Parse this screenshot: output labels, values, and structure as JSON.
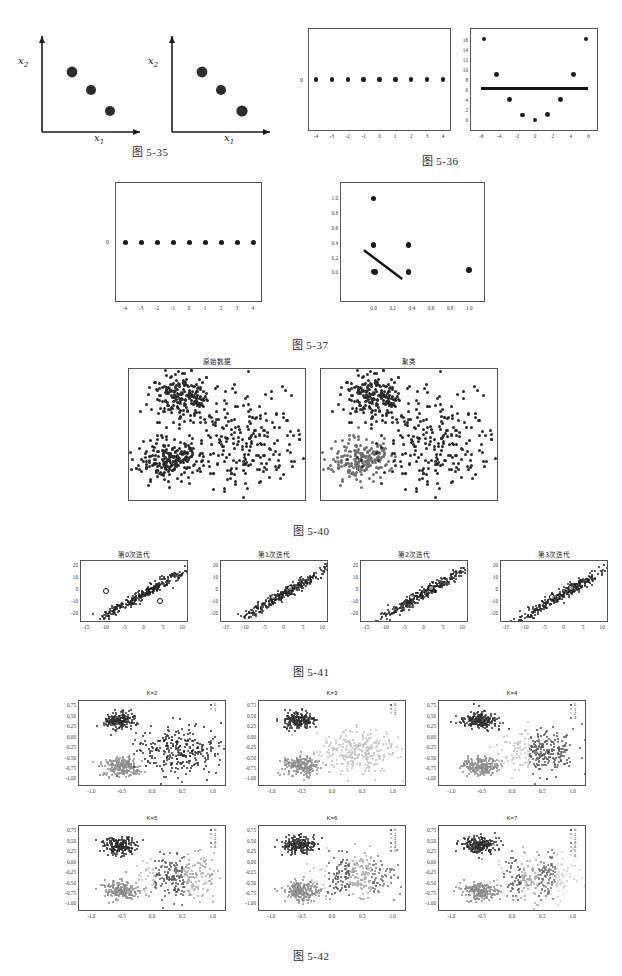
{
  "page": {
    "width": 622,
    "height": 976,
    "background": "#ffffff"
  },
  "figures": [
    {
      "id": "fig-5-35",
      "caption": "图 5-35",
      "panels": [
        {
          "id": "fig535-left",
          "axis_labels": {
            "x": "x",
            "x_sub": "1",
            "y": "x",
            "y_sub": "2"
          },
          "points": [
            [
              0.3,
              0.72
            ],
            [
              0.48,
              0.5
            ],
            [
              0.66,
              0.28
            ]
          ]
        },
        {
          "id": "fig535-right",
          "axis_labels": {
            "x": "x",
            "x_sub": "1",
            "y": "x",
            "y_sub": "2"
          },
          "points": [
            [
              0.3,
              0.72
            ],
            [
              0.48,
              0.5
            ],
            [
              0.66,
              0.28
            ]
          ]
        }
      ]
    },
    {
      "id": "fig-5-36",
      "caption": "图 5-36",
      "panels": [
        {
          "id": "fig536-left",
          "xticks": [
            "-4",
            "-3",
            "-2",
            "-1",
            "0",
            "1",
            "2",
            "3",
            "4"
          ],
          "yticks": [
            "0"
          ],
          "points_x": [
            -4,
            -3,
            -2,
            -1,
            0,
            1,
            2,
            3,
            4
          ],
          "points_y": [
            0,
            0,
            0,
            0,
            0,
            0,
            0,
            0,
            0
          ]
        },
        {
          "id": "fig536-right",
          "xticks": [
            "-6",
            "-4",
            "-2",
            "0",
            "2",
            "4",
            "6"
          ],
          "yticks": [
            "0",
            "2",
            "4",
            "6",
            "8",
            "10",
            "12",
            "14",
            "16"
          ],
          "points_x": [
            -5.7,
            -4.28,
            -2.85,
            -1.43,
            0,
            1.43,
            2.85,
            4.28,
            5.7
          ],
          "points_y": [
            16.2,
            9.1,
            4.1,
            1.1,
            0.1,
            1.2,
            4.2,
            9.1,
            16.2
          ],
          "regression_line": {
            "y": 6.4,
            "x_from": -6.0,
            "x_to": 5.9
          }
        }
      ]
    },
    {
      "id": "fig-5-37",
      "caption": "图 5-37",
      "panels": [
        {
          "id": "fig537-left",
          "xticks": [
            "-4",
            "-3",
            "-2",
            "-1",
            "0",
            "1",
            "2",
            "3",
            "4"
          ],
          "yticks": [
            "0"
          ],
          "points_x": [
            -4,
            -3,
            -2,
            -1,
            0,
            1,
            2,
            3,
            4
          ],
          "points_y": [
            0,
            0,
            0,
            0,
            0,
            0,
            0,
            0,
            0
          ]
        },
        {
          "id": "fig537-right",
          "xticks": [
            "0.0",
            "0.2",
            "0.4",
            "0.6",
            "0.8",
            "1.0"
          ],
          "yticks": [
            "0.0",
            "0.2",
            "0.4",
            "0.6",
            "0.8",
            "1.0"
          ],
          "points": [
            [
              0.0,
              1.0
            ],
            [
              0.0,
              0.37
            ],
            [
              0.365,
              0.37
            ],
            [
              0.0,
              0.012
            ],
            [
              0.012,
              0.005
            ],
            [
              0.365,
              0.008
            ],
            [
              1.0,
              0.03
            ]
          ],
          "regression_line": {
            "x_from": -0.1,
            "y_from": 0.3,
            "x_to": 0.3,
            "y_to": -0.09
          }
        }
      ]
    },
    {
      "id": "fig-5-40",
      "caption": "图 5-40",
      "panels": [
        {
          "id": "fig540-left",
          "title": "原始数据",
          "clusters": 1
        },
        {
          "id": "fig540-right",
          "title": "聚类",
          "clusters": 3
        }
      ]
    },
    {
      "id": "fig-5-41",
      "caption": "图 5-41",
      "panels": [
        {
          "id": "fig541-p0",
          "title": "第0次迭代",
          "xticks": [
            "-15",
            "-10",
            "-5",
            "0",
            "5",
            "10"
          ],
          "yticks": [
            "-20",
            "-10",
            "0",
            "10",
            "20"
          ],
          "centroids": [
            [
              -10.0,
              -0.6
            ],
            [
              4.0,
              -8.8
            ]
          ]
        },
        {
          "id": "fig541-p1",
          "title": "第1次迭代",
          "xticks": [
            "-15",
            "-10",
            "-5",
            "0",
            "5",
            "10"
          ],
          "yticks": [
            "-20",
            "-10",
            "0",
            "10",
            "20"
          ],
          "centroids": [
            [
              -3.0,
              -6.0
            ],
            [
              1.5,
              1.5
            ]
          ]
        },
        {
          "id": "fig541-p2",
          "title": "第2次迭代",
          "xticks": [
            "-15",
            "-10",
            "-5",
            "0",
            "5",
            "10"
          ],
          "yticks": [
            "-20",
            "-10",
            "0",
            "10",
            "20"
          ],
          "centroids": [
            [
              -3.2,
              -5.5
            ],
            [
              1.6,
              1.8
            ]
          ]
        },
        {
          "id": "fig541-p3",
          "title": "第3次迭代",
          "xticks": [
            "-15",
            "-10",
            "-5",
            "0",
            "5",
            "10"
          ],
          "yticks": [
            "-20",
            "-10",
            "0",
            "10",
            "20"
          ],
          "centroids": [
            [
              -3.3,
              -5.4
            ],
            [
              1.7,
              1.9
            ]
          ]
        }
      ]
    },
    {
      "id": "fig-5-42",
      "caption": "图 5-42",
      "xticks": [
        "-1.0",
        "-0.5",
        "0.0",
        "0.5",
        "1.0"
      ],
      "yticks": [
        "0.75",
        "0.50",
        "0.25",
        "0.00",
        "-0.25",
        "-0.50",
        "-0.75",
        "-1.00"
      ],
      "panels": [
        {
          "id": "fig542-k2",
          "title": "K=2",
          "k": 2,
          "legend": [
            "0",
            "1"
          ]
        },
        {
          "id": "fig542-k3",
          "title": "K=3",
          "k": 3,
          "legend": [
            "0",
            "1",
            "2"
          ]
        },
        {
          "id": "fig542-k4",
          "title": "K=4",
          "k": 4,
          "legend": [
            "0",
            "1",
            "2",
            "3"
          ]
        },
        {
          "id": "fig542-k5",
          "title": "K=5",
          "k": 5,
          "legend": [
            "0",
            "1",
            "2",
            "3",
            "4"
          ]
        },
        {
          "id": "fig542-k6",
          "title": "K=6",
          "k": 6,
          "legend": [
            "0",
            "1",
            "2",
            "3",
            "4",
            "5"
          ]
        },
        {
          "id": "fig542-k7",
          "title": "K=7",
          "k": 7,
          "legend": [
            "0",
            "1",
            "2",
            "3",
            "4",
            "5",
            "6"
          ]
        }
      ]
    }
  ],
  "colors": {
    "ink": "#1b1b1b",
    "axis": "#555555",
    "cluster_dark": "#2b2b2b",
    "cluster_mid": "#6f6f6f",
    "cluster_light": "#b0b0b0",
    "line": "#111111"
  }
}
